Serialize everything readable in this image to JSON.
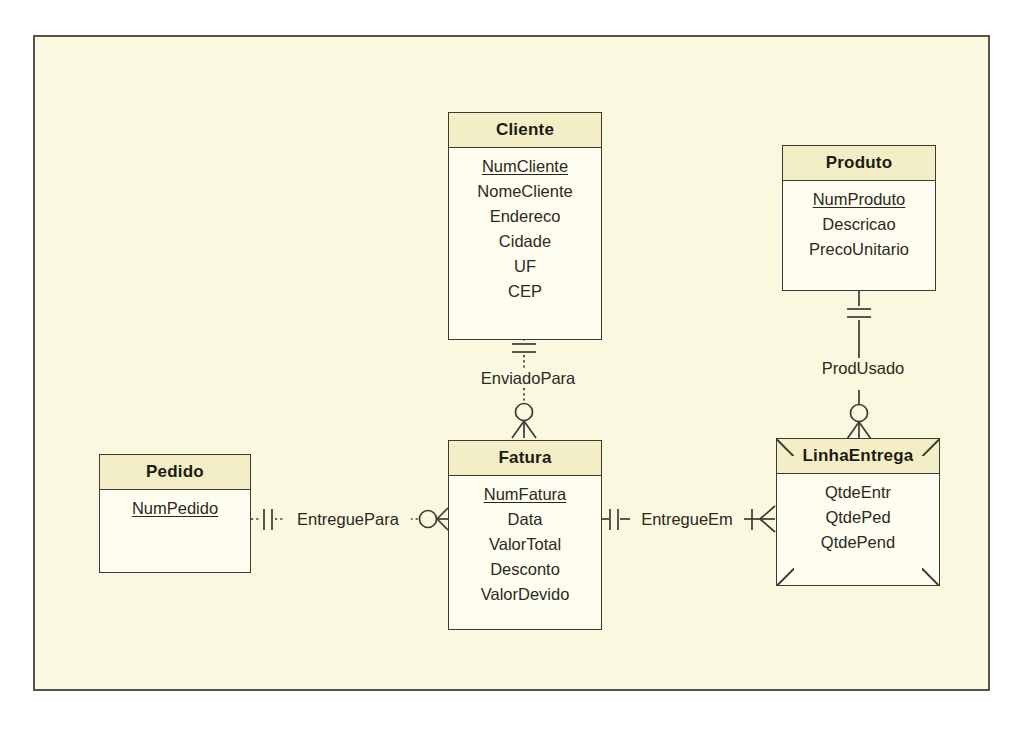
{
  "diagram": {
    "notation": "crows-foot",
    "canvas": {
      "background_color": "#fbf8e0",
      "border_color": "#53544d"
    },
    "entity_style": {
      "header_fill": "#f4eec6",
      "body_fill": "#fefdf0",
      "line_color": "#3b3b33"
    }
  },
  "entities": [
    {
      "id": "cliente",
      "name": "Cliente",
      "kind": "independent",
      "attributes": [
        {
          "name": "NumCliente",
          "key": true
        },
        {
          "name": "NomeCliente",
          "key": false
        },
        {
          "name": "Endereco",
          "key": false
        },
        {
          "name": "Cidade",
          "key": false
        },
        {
          "name": "UF",
          "key": false
        },
        {
          "name": "CEP",
          "key": false
        }
      ]
    },
    {
      "id": "produto",
      "name": "Produto",
      "kind": "independent",
      "attributes": [
        {
          "name": "NumProduto",
          "key": true
        },
        {
          "name": "Descricao",
          "key": false
        },
        {
          "name": "PrecoUnitario",
          "key": false
        }
      ]
    },
    {
      "id": "pedido",
      "name": "Pedido",
      "kind": "independent",
      "attributes": [
        {
          "name": "NumPedido",
          "key": true
        }
      ]
    },
    {
      "id": "fatura",
      "name": "Fatura",
      "kind": "independent",
      "attributes": [
        {
          "name": "NumFatura",
          "key": true
        },
        {
          "name": "Data",
          "key": false
        },
        {
          "name": "ValorTotal",
          "key": false
        },
        {
          "name": "Desconto",
          "key": false
        },
        {
          "name": "ValorDevido",
          "key": false
        }
      ]
    },
    {
      "id": "linhaentrega",
      "name": "LinhaEntrega",
      "kind": "associative",
      "attributes": [
        {
          "name": "QtdeEntr",
          "key": false
        },
        {
          "name": "QtdePed",
          "key": false
        },
        {
          "name": "QtdePend",
          "key": false
        }
      ]
    }
  ],
  "relationships": [
    {
      "id": "enviadopara",
      "label": "EnviadoPara",
      "from": "cliente",
      "to": "fatura",
      "line": "dotted",
      "from_cardinality": "one-and-only-one",
      "to_cardinality": "zero-or-many"
    },
    {
      "id": "produsado",
      "label": "ProdUsado",
      "from": "produto",
      "to": "linhaentrega",
      "line": "solid",
      "from_cardinality": "one-and-only-one",
      "to_cardinality": "zero-or-many"
    },
    {
      "id": "entreguepara",
      "label": "EntreguePara",
      "from": "pedido",
      "to": "fatura",
      "line": "dotted",
      "from_cardinality": "one-and-only-one",
      "to_cardinality": "zero-or-many"
    },
    {
      "id": "entregueem",
      "label": "EntregueEm",
      "from": "fatura",
      "to": "linhaentrega",
      "line": "solid",
      "from_cardinality": "one-and-only-one",
      "to_cardinality": "one-or-many"
    }
  ]
}
